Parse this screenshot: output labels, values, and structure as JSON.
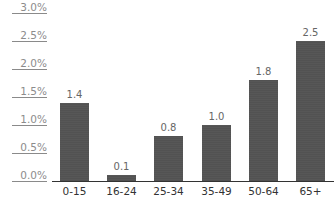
{
  "chart_data": {
    "type": "bar",
    "title": "",
    "xlabel": "",
    "ylabel": "",
    "categories": [
      "0-15",
      "16-24",
      "25-34",
      "35-49",
      "50-64",
      "65+"
    ],
    "values": [
      1.4,
      0.1,
      0.8,
      1.0,
      1.8,
      2.5
    ],
    "value_labels": [
      "1.4",
      "0.1",
      "0.8",
      "1.0",
      "1.8",
      "2.5"
    ],
    "ylim": [
      0,
      3.0
    ],
    "yticks": [
      0.0,
      0.5,
      1.0,
      1.5,
      2.0,
      2.5,
      3.0
    ],
    "ytick_labels": [
      "0.0%",
      "0.5%",
      "1.0%",
      "1.5%",
      "2.0%",
      "2.5%",
      "3.0%"
    ],
    "grid": false,
    "legend": null,
    "bar_color": "#575757"
  }
}
